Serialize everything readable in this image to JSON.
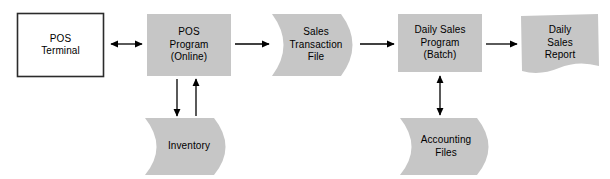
{
  "diagram": {
    "colors": {
      "shape_fill": "#c6c6c6",
      "shape_fill_dark": "#bdbdbd",
      "outline": "#2b2b2b",
      "arrow": "#000000",
      "background": "#ffffff",
      "text": "#000000"
    },
    "nodes": [
      {
        "id": "pos-terminal",
        "name": "pos-terminal",
        "shape": "rectangle-outline",
        "lines": [
          "POS",
          "Terminal"
        ],
        "x": 17,
        "y": 13,
        "width": 87,
        "height": 64
      },
      {
        "id": "pos-program",
        "name": "pos-program-online",
        "shape": "rectangle-filled",
        "lines": [
          "POS",
          "Program",
          "(Online)"
        ],
        "x": 147,
        "y": 14,
        "width": 84,
        "height": 62
      },
      {
        "id": "sales-transaction-file",
        "name": "sales-transaction-file",
        "shape": "data-store",
        "lines": [
          "Sales",
          "Transaction",
          "File"
        ],
        "x": 272,
        "y": 14,
        "width": 92,
        "height": 62
      },
      {
        "id": "daily-sales-program",
        "name": "daily-sales-program-batch",
        "shape": "rectangle-filled",
        "lines": [
          "Daily Sales",
          "Program",
          "(Batch)"
        ],
        "x": 398,
        "y": 14,
        "width": 84,
        "height": 58
      },
      {
        "id": "daily-sales-report",
        "name": "daily-sales-report",
        "shape": "document",
        "lines": [
          "Daily",
          "Sales",
          "Report"
        ],
        "x": 521,
        "y": 14,
        "width": 78,
        "height": 62
      },
      {
        "id": "inventory",
        "name": "inventory-data-store",
        "shape": "data-store",
        "lines": [
          "Inventory"
        ],
        "x": 145,
        "y": 118,
        "width": 92,
        "height": 57
      },
      {
        "id": "accounting-files",
        "name": "accounting-files-data-store",
        "shape": "data-store",
        "lines": [
          "Accounting",
          "Files"
        ],
        "x": 400,
        "y": 118,
        "width": 100,
        "height": 57
      }
    ],
    "connectors": [
      {
        "id": "terminal-to-program",
        "name": "connector-pos-terminal-pos-program",
        "direction": "bidirectional",
        "orientation": "horizontal",
        "from": "pos-terminal",
        "to": "pos-program",
        "x1": 109,
        "y1": 44,
        "x2": 144,
        "y2": 44
      },
      {
        "id": "program-to-transaction-file",
        "name": "connector-pos-program-sales-transaction-file",
        "direction": "forward",
        "orientation": "horizontal",
        "from": "pos-program",
        "to": "sales-transaction-file",
        "x1": 234,
        "y1": 44,
        "x2": 270,
        "y2": 44
      },
      {
        "id": "transaction-file-to-daily-program",
        "name": "connector-sales-transaction-file-daily-sales-program",
        "direction": "forward",
        "orientation": "horizontal",
        "from": "sales-transaction-file",
        "to": "daily-sales-program",
        "x1": 359,
        "y1": 44,
        "x2": 395,
        "y2": 44
      },
      {
        "id": "daily-program-to-report",
        "name": "connector-daily-sales-program-daily-sales-report",
        "direction": "forward",
        "orientation": "horizontal",
        "from": "daily-sales-program",
        "to": "daily-sales-report",
        "x1": 484,
        "y1": 44,
        "x2": 518,
        "y2": 44
      },
      {
        "id": "program-to-inventory",
        "name": "connector-pos-program-inventory-write",
        "direction": "forward",
        "orientation": "vertical-down",
        "from": "pos-program",
        "to": "inventory",
        "x1": 177,
        "y1": 79,
        "x2": 177,
        "y2": 117
      },
      {
        "id": "inventory-to-program",
        "name": "connector-inventory-pos-program-read",
        "direction": "forward",
        "orientation": "vertical-up",
        "from": "inventory",
        "to": "pos-program",
        "x1": 196,
        "y1": 117,
        "x2": 196,
        "y2": 79
      },
      {
        "id": "daily-program-accounting-files",
        "name": "connector-daily-sales-program-accounting-files",
        "direction": "bidirectional",
        "orientation": "vertical",
        "from": "daily-sales-program",
        "to": "accounting-files",
        "x1": 440,
        "y1": 75,
        "x2": 440,
        "y2": 116
      }
    ]
  }
}
